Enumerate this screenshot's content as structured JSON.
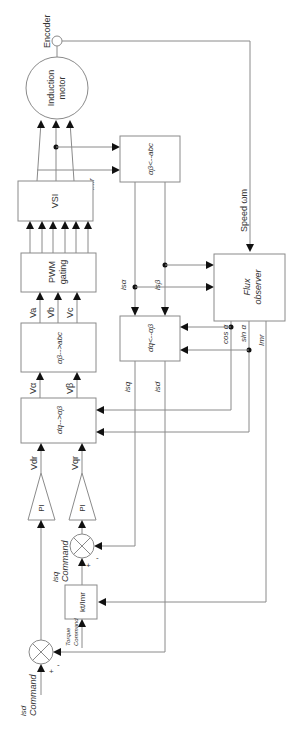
{
  "diagram": {
    "orientation": "rotated -90 degrees",
    "blocks": {
      "encoder": "Encoder",
      "motor_line1": "Induction",
      "motor_line2": "motor",
      "vsi": "VSI",
      "pwm_line1": "PWM",
      "pwm_line2": "gating",
      "ab_to_abc": "αβ-->abc",
      "dq_to_ab": "dq-->αβ",
      "ab_from_abc": "αβ<--abc",
      "dq_from_ab": "dq<--αβ",
      "flux_line1": "Flux",
      "flux_line2": "observer",
      "pi1": "PI",
      "pi2": "PI",
      "gain": "kt/Imr"
    },
    "signals": {
      "speed": "Speed ωm",
      "imr_top": "Imr",
      "isa": "isα",
      "isb": "isβ",
      "cos": "cos α",
      "sin": "sin α",
      "imr": "Imr",
      "va": "Va",
      "vb": "Vb",
      "vc": "Vc",
      "v_alpha": "Vα",
      "v_beta": "Vβ",
      "vdr": "Vdr",
      "vqr": "Vqr",
      "isq": "isq",
      "isd": "isd",
      "isq_cmd_1": "isq",
      "isq_cmd_2": "Command",
      "isd_cmd_1": "isd",
      "isd_cmd_2": "Command",
      "torque_1": "Torque",
      "torque_2": "Command",
      "plus": "+",
      "minus": "-"
    }
  }
}
